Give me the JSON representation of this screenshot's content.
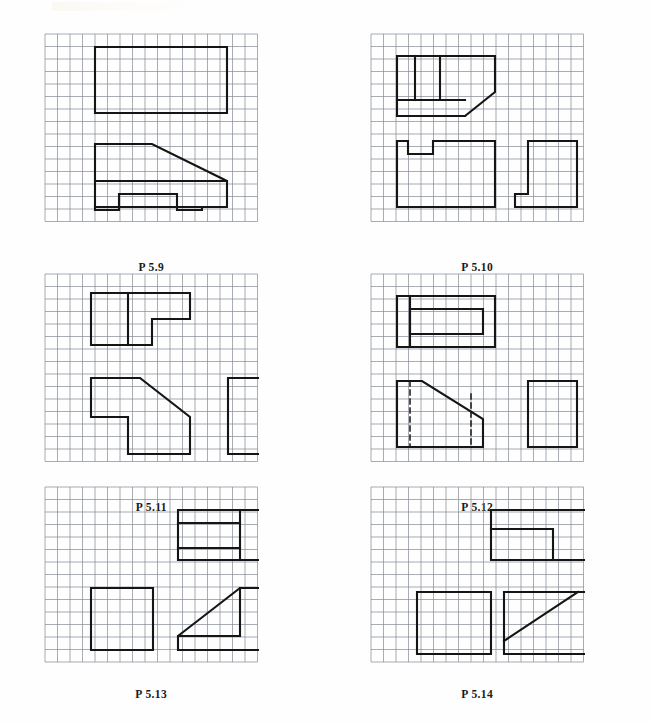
{
  "page": {
    "width": 652,
    "height": 723,
    "background": "#fefefe",
    "ink": "#151515",
    "grid_color": "#6e7480",
    "grid_step": 12.5,
    "stroke_width": 2.1,
    "grid_stroke_width": 0.7
  },
  "panels": [
    {
      "id": "p59",
      "caption": "P 5.9",
      "origin": {
        "x": 44,
        "y": 33
      },
      "grid": {
        "cols": 17,
        "rows": 15
      },
      "caption_y": 228,
      "views": [
        {
          "name": "top-view",
          "type": "polygon",
          "points": "50,13 182,13 182,79 50,79"
        },
        {
          "name": "front-view",
          "type": "polygon",
          "points": "50,110 107,110 182,147 182,173 50,173"
        },
        {
          "name": "front-view-horizontal-divider",
          "type": "polyline",
          "points": "50,147 182,147"
        },
        {
          "name": "front-view-base-notch",
          "type": "polyline",
          "points": "50,173 50,176 74,176 74,160 132,160 132,176 157,176 157,173"
        },
        {
          "name": "side-view",
          "type": "polygon",
          "points": "220,147 245,147 245,110 282,110 282,176 220,176"
        },
        {
          "name": "side-view-divider",
          "type": "polyline",
          "points": "245,147 282,147"
        }
      ]
    },
    {
      "id": "p510",
      "caption": "P 5.10",
      "origin": {
        "x": 370,
        "y": 33
      },
      "grid": {
        "cols": 17,
        "rows": 15
      },
      "caption_y": 228,
      "views": [
        {
          "name": "top-view",
          "type": "polygon",
          "points": "26,22 124,22 124,58 94,82 26,82"
        },
        {
          "name": "top-view-rib-1",
          "type": "polyline",
          "points": "44,22 44,66"
        },
        {
          "name": "top-view-rib-2",
          "type": "polyline",
          "points": "69,22 69,66"
        },
        {
          "name": "top-view-shelf",
          "type": "polyline",
          "points": "26,66 94,66"
        },
        {
          "name": "top-view-chamfer-edge",
          "type": "polyline",
          "points": "26,82 94,82"
        },
        {
          "name": "front-view",
          "type": "polygon",
          "points": "26,107 37,107 37,120 62,120 62,107 124,107 124,173 26,173"
        },
        {
          "name": "side-view",
          "type": "polygon",
          "points": "157,107 206,107 206,173 144,173 144,160 157,160"
        }
      ]
    },
    {
      "id": "p511",
      "caption": "P 5.11",
      "origin": {
        "x": 44,
        "y": 273
      },
      "grid": {
        "cols": 17,
        "rows": 15
      },
      "caption_y": 228,
      "views": [
        {
          "name": "top-view",
          "type": "polygon",
          "points": "46,19 145,19 145,45 107,45 107,71 46,71"
        },
        {
          "name": "top-view-divider",
          "type": "polyline",
          "points": "83,19 83,71"
        },
        {
          "name": "front-view",
          "type": "polygon",
          "points": "46,104 95,104 145,143 145,180 83,180 83,143 46,143"
        },
        {
          "name": "side-view",
          "type": "polygon",
          "points": "183,104 232,104 232,180 183,180"
        }
      ]
    },
    {
      "id": "p512",
      "caption": "P 5.12",
      "origin": {
        "x": 370,
        "y": 273
      },
      "grid": {
        "cols": 17,
        "rows": 15
      },
      "caption_y": 228,
      "views": [
        {
          "name": "top-view-outer",
          "type": "polygon",
          "points": "26,22 124,22 124,73 26,73"
        },
        {
          "name": "top-view-inner",
          "type": "polygon",
          "points": "39,35 112,35 112,60 39,60"
        },
        {
          "name": "top-view-rib",
          "type": "polyline",
          "points": "39,22 39,73"
        },
        {
          "name": "front-view",
          "type": "polygon",
          "points": "26,107 51,107 112,145 112,173 26,173"
        },
        {
          "name": "front-view-hidden-line-left",
          "type": "polyline-dashed",
          "points": "39,107 39,173"
        },
        {
          "name": "front-view-hidden-line-right",
          "type": "polyline-dashed",
          "points": "100,120 100,173"
        },
        {
          "name": "side-view",
          "type": "polygon",
          "points": "157,107 206,107 206,173 157,173"
        }
      ]
    },
    {
      "id": "p513",
      "caption": "P 5.13",
      "origin": {
        "x": 44,
        "y": 486
      },
      "grid": {
        "cols": 17,
        "rows": 14
      },
      "caption_y": 202,
      "views": [
        {
          "name": "top-view",
          "type": "polygon",
          "points": "133,23 220,23 220,73 133,73"
        },
        {
          "name": "top-view-divider-1",
          "type": "polyline",
          "points": "133,36 195,36"
        },
        {
          "name": "top-view-divider-2",
          "type": "polyline",
          "points": "133,61 195,61"
        },
        {
          "name": "top-view-rib",
          "type": "polyline",
          "points": "195,23 195,73"
        },
        {
          "name": "front-view",
          "type": "polygon",
          "points": "46,101 108,101 108,163 46,163"
        },
        {
          "name": "side-view",
          "type": "polygon",
          "points": "133,149 195,101 220,101 220,163 133,163"
        },
        {
          "name": "side-view-ledge",
          "type": "polyline",
          "points": "133,149 195,149"
        },
        {
          "name": "side-view-riser",
          "type": "polyline",
          "points": "195,101 195,149"
        }
      ]
    },
    {
      "id": "p514",
      "caption": "P 5.14",
      "origin": {
        "x": 370,
        "y": 486
      },
      "grid": {
        "cols": 17,
        "rows": 14
      },
      "caption_y": 202,
      "views": [
        {
          "name": "top-view",
          "type": "polygon",
          "points": "120,23 220,23 220,73 120,73"
        },
        {
          "name": "top-view-step",
          "type": "polyline",
          "points": "120,42 182,42 182,73"
        },
        {
          "name": "front-view",
          "type": "polygon",
          "points": "46,105 120,105 120,167 46,167"
        },
        {
          "name": "side-view",
          "type": "polygon",
          "points": "133,105 220,105 220,167 133,167"
        },
        {
          "name": "side-view-diagonal",
          "type": "polyline",
          "points": "133,154 207,105"
        }
      ]
    }
  ]
}
